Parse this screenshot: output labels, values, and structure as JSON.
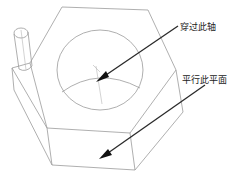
{
  "annotations": [
    {
      "id": "axis",
      "text": "穿过此轴"
    },
    {
      "id": "plane",
      "text": "平行此平面"
    }
  ],
  "colors": {
    "edge": "#9a9a9a",
    "leader": "#2a2a2a",
    "background": "#ffffff"
  }
}
